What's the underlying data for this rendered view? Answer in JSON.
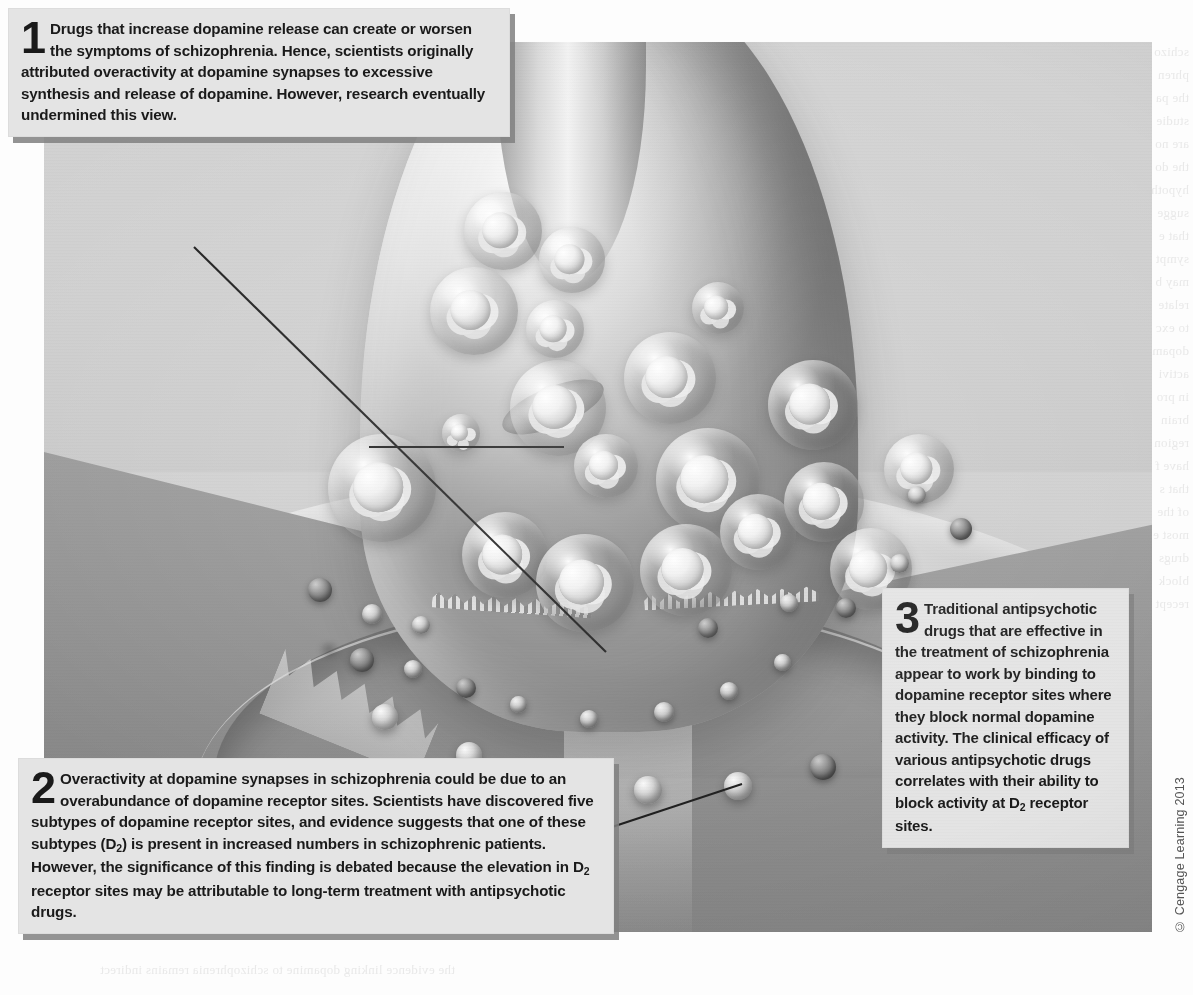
{
  "figure": {
    "copyright": "© Cengage Learning 2013",
    "background_color": "#cfcfcf",
    "callout_box_color": "#e4e4e4",
    "leader_line_color": "#1a1a1a"
  },
  "callouts": [
    {
      "number": "1",
      "text": "Drugs that increase dopamine release can create or worsen the symptoms of schizophrenia. Hence, scientists originally attributed overactivity at dopamine synapses to excessive synthesis and release of dopamine. However, research eventually undermined this view."
    },
    {
      "number": "2",
      "text_part_1": "Overactivity at dopamine synapses in schizophrenia could be due to an overabundance of dopamine receptor sites. Scientists have discovered five subtypes of dopamine receptor sites, and evidence suggests that one of these subtypes (D",
      "sub_1": "2",
      "text_part_2": ") is present in increased numbers in schizophrenic patients. However, the significance of this finding is debated because the elevation in D",
      "sub_2": "2",
      "text_part_3": " receptor sites may be attributable to long-term treatment with antipsychotic drugs."
    },
    {
      "number": "3",
      "text_part_1": "Traditional antipsychotic drugs that are effective in the treatment of schizophrenia appear to work by binding to dopamine receptor sites where they block normal dopamine activity. The clinical efficacy of various antipsychotic drugs correlates with their ability to block activity at D",
      "sub_1": "2",
      "text_part_2": " receptor sites."
    }
  ],
  "illustration_parts": {
    "presynaptic_terminal": "axon terminal bulb containing synaptic vesicles",
    "vesicles": "synaptic vesicles filled with dopamine molecules",
    "mitochondrion": "mitochondrion inside the terminal",
    "synaptic_cleft": "gap between presynaptic terminal and postsynaptic membrane",
    "neurotransmitters": "dopamine molecules released into the synaptic cleft",
    "receptor_sites": "dopamine receptor sites on the postsynaptic membrane",
    "postsynaptic_cell": "postsynaptic dendrite membrane"
  },
  "show_through_text": {
    "right_column": "schizo\nphren\nthe pa\nstudie\nare no\nthe do\nhypoth\nsugge\nthat e\nsympt\nmay b\nrelate\nto exc\ndopam\nactivi\nin pro\nbrain\nregion\nhave f\nthat s\nof the\nmost e\ndrugs\nblock\nrecept",
    "bottom_row": "the evidence linking dopamine to schizophrenia remains indirect"
  }
}
